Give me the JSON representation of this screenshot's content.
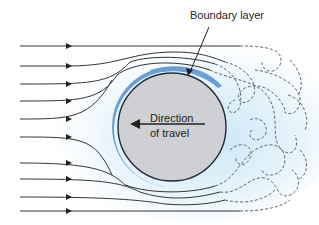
{
  "diagram": {
    "labels": {
      "boundary_layer": "Boundary layer",
      "direction_line1": "Direction",
      "direction_line2": "of travel"
    },
    "colors": {
      "sphere_fill": "#cfd0d4",
      "sphere_outline": "#1e2a3a",
      "boundary_layer": "#6a9fd6",
      "flow_tint": "#cfe8f6",
      "streamline": "#333333",
      "wake_dashed": "#555555"
    },
    "streamline_y_positions": [
      46,
      66,
      84,
      101,
      119,
      137,
      163,
      179,
      197,
      211
    ]
  }
}
